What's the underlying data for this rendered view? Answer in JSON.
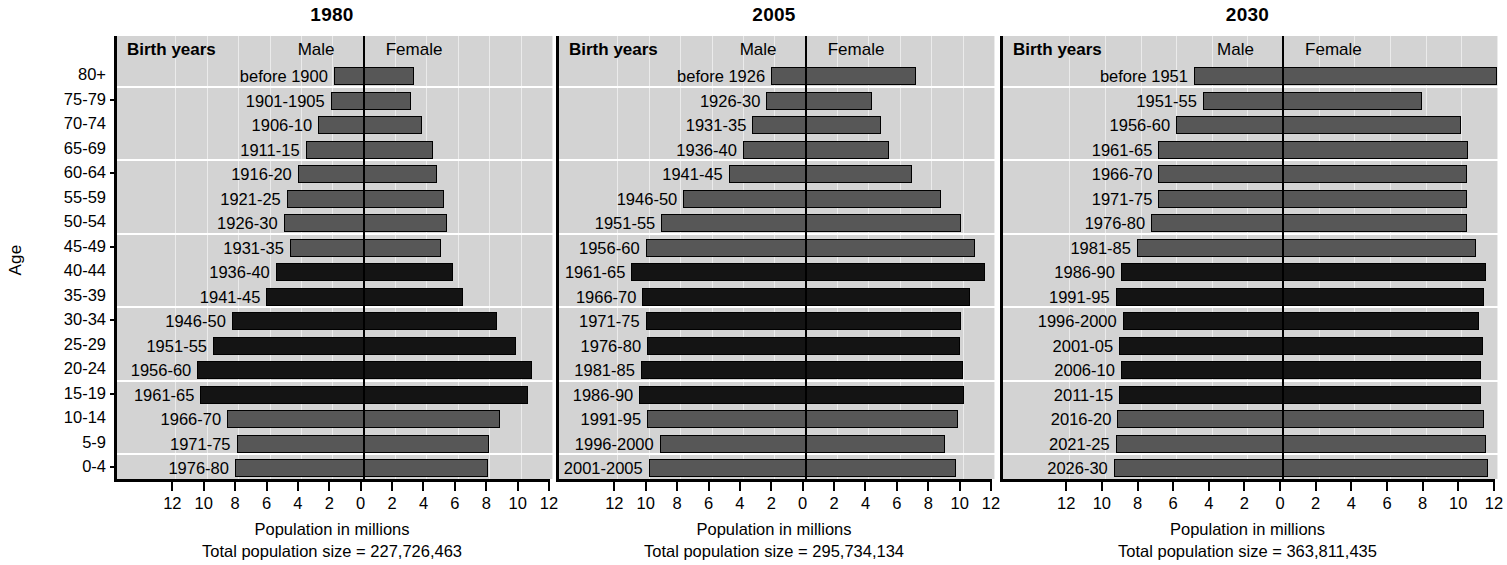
{
  "y_axis_title": "Age",
  "age_groups": [
    "80+",
    "75-79",
    "70-74",
    "65-69",
    "60-64",
    "55-59",
    "50-54",
    "45-49",
    "40-44",
    "35-39",
    "30-34",
    "25-29",
    "20-24",
    "15-19",
    "10-14",
    "5-9",
    "0-4"
  ],
  "column_headers": {
    "birth_years": "Birth years",
    "male": "Male",
    "female": "Female"
  },
  "x_axis": {
    "label": "Population in millions",
    "ticks": [
      "12",
      "10",
      "8",
      "6",
      "4",
      "2",
      "0",
      "2",
      "4",
      "6",
      "8",
      "10",
      "12"
    ],
    "max": 12
  },
  "totals_prefix": "Total population size = ",
  "chart_data": {
    "type": "bar",
    "xlabel": "Population in millions",
    "ylabel": "Age",
    "xlim": [
      -12,
      12
    ],
    "grid": true,
    "legend_position": "top-inside",
    "categories": [
      "80+",
      "75-79",
      "70-74",
      "65-69",
      "60-64",
      "55-59",
      "50-54",
      "45-49",
      "40-44",
      "35-39",
      "30-34",
      "25-29",
      "20-24",
      "15-19",
      "10-14",
      "5-9",
      "0-4"
    ],
    "panels": [
      {
        "year": "1980",
        "total_population": "227,726,463",
        "total_label": "Total population size = 227,726,463",
        "birth_years": [
          "before 1900",
          "1901-1905",
          "1906-10",
          "1911-15",
          "1916-20",
          "1921-25",
          "1926-30",
          "1931-35",
          "1936-40",
          "1941-45",
          "1946-50",
          "1951-55",
          "1956-60",
          "1961-65",
          "1966-70",
          "1971-75",
          "1976-80"
        ],
        "male": [
          1.9,
          2.1,
          2.9,
          3.7,
          4.2,
          4.9,
          5.1,
          4.7,
          5.6,
          6.2,
          8.4,
          9.6,
          10.6,
          10.4,
          8.7,
          8.1,
          8.2
        ],
        "female": [
          3.2,
          3.0,
          3.7,
          4.4,
          4.7,
          5.1,
          5.3,
          4.9,
          5.7,
          6.3,
          8.5,
          9.7,
          10.7,
          10.5,
          8.7,
          8.0,
          7.9
        ],
        "shade": [
          "mid",
          "mid",
          "mid",
          "mid",
          "mid",
          "mid",
          "mid",
          "mid",
          "dark",
          "dark",
          "dark",
          "dark",
          "dark",
          "dark",
          "mid",
          "mid",
          "mid"
        ]
      },
      {
        "year": "2005",
        "total_population": "295,734,134",
        "total_label": "Total population size = 295,734,134",
        "birth_years": [
          "before 1926",
          "1926-30",
          "1931-35",
          "1936-40",
          "1941-45",
          "1946-50",
          "1951-55",
          "1956-60",
          "1961-65",
          "1966-70",
          "1971-75",
          "1976-80",
          "1981-85",
          "1986-90",
          "1991-95",
          "1996-2000",
          "2001-2005"
        ],
        "male": [
          2.2,
          2.5,
          3.4,
          4.0,
          4.9,
          7.8,
          9.2,
          10.2,
          11.1,
          10.4,
          10.2,
          10.1,
          10.5,
          10.6,
          10.1,
          9.3,
          10.0
        ],
        "female": [
          7.0,
          4.2,
          4.8,
          5.3,
          6.8,
          8.6,
          9.9,
          10.8,
          11.4,
          10.5,
          9.9,
          9.8,
          10.0,
          10.1,
          9.7,
          8.9,
          9.6
        ],
        "shade": [
          "mid",
          "mid",
          "mid",
          "mid",
          "mid",
          "mid",
          "mid",
          "mid",
          "dark",
          "dark",
          "dark",
          "dark",
          "dark",
          "dark",
          "mid",
          "mid",
          "mid"
        ]
      },
      {
        "year": "2030",
        "total_population": "363,811,435",
        "total_label": "Total population size = 363,811,435",
        "birth_years": [
          "before 1951",
          "1951-55",
          "1956-60",
          "1961-65",
          "1966-70",
          "1971-75",
          "1976-80",
          "1981-85",
          "1986-90",
          "1991-95",
          "1996-2000",
          "2001-05",
          "2006-10",
          "2011-15",
          "2016-20",
          "2021-25",
          "2026-30"
        ],
        "male": [
          5.0,
          4.5,
          6.0,
          7.0,
          7.0,
          7.0,
          7.4,
          8.2,
          9.1,
          9.4,
          9.0,
          9.2,
          9.1,
          9.2,
          9.3,
          9.4,
          9.5
        ],
        "female": [
          12.0,
          7.8,
          10.0,
          10.4,
          10.3,
          10.3,
          10.3,
          10.8,
          11.4,
          11.3,
          11.0,
          11.2,
          11.1,
          11.1,
          11.3,
          11.4,
          11.5
        ],
        "shade": [
          "mid",
          "mid",
          "mid",
          "mid",
          "mid",
          "mid",
          "mid",
          "mid",
          "dark",
          "dark",
          "dark",
          "dark",
          "dark",
          "dark",
          "mid",
          "mid",
          "mid"
        ]
      }
    ],
    "colors": {
      "bar_mid": "#575757",
      "bar_dark": "#141414",
      "panel_bg": "#d3d3d3",
      "axis": "#000000"
    }
  }
}
